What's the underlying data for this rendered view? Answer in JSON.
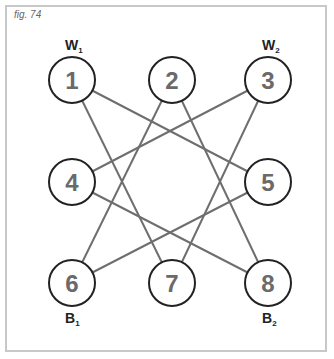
{
  "figure_label": "fig. 74",
  "nodes": [
    {
      "id": "1",
      "x": 72,
      "y": 80
    },
    {
      "id": "2",
      "x": 172,
      "y": 80
    },
    {
      "id": "3",
      "x": 268,
      "y": 80
    },
    {
      "id": "4",
      "x": 72,
      "y": 182
    },
    {
      "id": "5",
      "x": 268,
      "y": 182
    },
    {
      "id": "6",
      "x": 72,
      "y": 283
    },
    {
      "id": "7",
      "x": 172,
      "y": 283
    },
    {
      "id": "8",
      "x": 268,
      "y": 283
    }
  ],
  "edges": [
    [
      "1",
      "5"
    ],
    [
      "1",
      "7"
    ],
    [
      "2",
      "6"
    ],
    [
      "2",
      "8"
    ],
    [
      "3",
      "4"
    ],
    [
      "3",
      "7"
    ],
    [
      "4",
      "8"
    ],
    [
      "5",
      "6"
    ]
  ],
  "labels": [
    {
      "text": "W",
      "sub": "1",
      "near": "1"
    },
    {
      "text": "W",
      "sub": "2",
      "near": "3"
    },
    {
      "text": "B",
      "sub": "1",
      "near": "6"
    },
    {
      "text": "B",
      "sub": "2",
      "near": "8"
    }
  ],
  "colors": {
    "edge": "#6e6e6e",
    "circle_stroke": "#222222",
    "number": "#6a6a6a",
    "border": "#c8c8c8"
  }
}
